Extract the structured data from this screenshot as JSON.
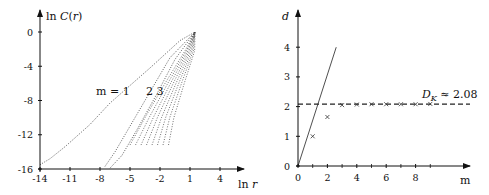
{
  "chart_data": [
    {
      "type": "scatter",
      "title": "",
      "xlabel": "ln r",
      "ylabel": "ln C(r)",
      "xlim": [
        -14,
        5.5
      ],
      "ylim": [
        -16,
        1.5
      ],
      "x_ticks": [
        -14,
        -11,
        -8,
        -5,
        -2,
        1,
        4
      ],
      "y_ticks": [
        0,
        -4,
        -8,
        -12,
        -16
      ],
      "grid": false,
      "annotations": [
        {
          "text": "m = 1",
          "x": -9.4,
          "y": -9.0
        },
        {
          "text": "2 3",
          "x": -5.0,
          "y": -9.0
        }
      ],
      "series": [
        {
          "name": "m=1",
          "style": "dotted",
          "points": [
            [
              -14,
              -15.5
            ],
            [
              -13,
              -14.8
            ],
            [
              -11.5,
              -13.4
            ],
            [
              -9,
              -10.8
            ],
            [
              -7,
              -8.3
            ],
            [
              -3,
              -4.2
            ],
            [
              0,
              -1.0
            ],
            [
              1.5,
              0
            ]
          ]
        },
        {
          "name": "m=2",
          "style": "dotted",
          "points": [
            [
              -7.5,
              -15.7
            ],
            [
              -6.5,
              -14.0
            ],
            [
              -5,
              -11.0
            ],
            [
              -3,
              -7.0
            ],
            [
              -1,
              -3.0
            ],
            [
              1.5,
              0
            ]
          ]
        },
        {
          "name": "m=3",
          "style": "dotted",
          "points": [
            [
              -7,
              -15.9
            ],
            [
              -5.8,
              -14.4
            ],
            [
              -4.2,
              -11.2
            ],
            [
              -2.3,
              -7.2
            ],
            [
              -0.5,
              -3.2
            ],
            [
              1.5,
              0
            ]
          ]
        },
        {
          "name": "m=4..10",
          "style": "dotted-fan",
          "points": [
            [
              -5,
              -13.2
            ],
            [
              -3.5,
              -10.0
            ],
            [
              -1.5,
              -6.0
            ],
            [
              0.5,
              -2.2
            ],
            [
              1.5,
              0
            ]
          ]
        }
      ]
    },
    {
      "type": "line",
      "title": "",
      "xlabel": "m",
      "ylabel": "d",
      "xlim": [
        0,
        11.5
      ],
      "ylim": [
        0,
        4.5
      ],
      "x_ticks": [
        0,
        2,
        4,
        6,
        8
      ],
      "x_minor_ticks": [
        1,
        3,
        5,
        7,
        9
      ],
      "y_ticks": [
        0,
        1,
        2,
        3,
        4
      ],
      "grid": false,
      "series": [
        {
          "name": "d = m",
          "style": "solid",
          "x": [
            0,
            2.6
          ],
          "values": [
            0,
            4.0
          ]
        },
        {
          "name": "D_K",
          "style": "dashed",
          "x": [
            0,
            11.5
          ],
          "values": [
            2.08,
            2.08
          ]
        },
        {
          "name": "estimated d",
          "style": "markers-x",
          "x": [
            1,
            2,
            3,
            4,
            5,
            6,
            7,
            8,
            9
          ],
          "values": [
            1.0,
            1.65,
            2.05,
            2.07,
            2.08,
            2.08,
            2.08,
            2.08,
            2.09
          ]
        }
      ],
      "annotations": [
        {
          "text": "D_K ≈ 2.08",
          "x": 8.3,
          "y": 2.3
        }
      ]
    }
  ],
  "left_chart": {
    "ylabel": "ln C(r)",
    "xlabel": "ln r",
    "label_m1": "m = 1",
    "label_m23": "2 3"
  },
  "right_chart": {
    "ylabel": "d",
    "xlabel": "m",
    "dk_main": "D",
    "dk_sub": "K",
    "dk_rest": " ≈ 2.08"
  }
}
